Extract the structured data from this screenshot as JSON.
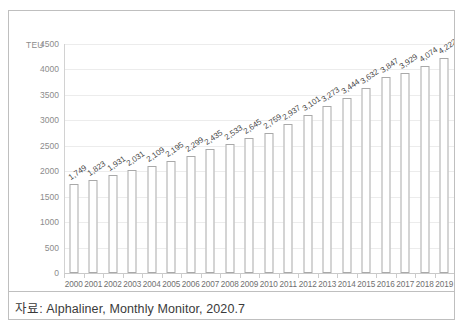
{
  "figure": {
    "unit_label": "TEU",
    "source_caption": "자료: Alphaliner, Monthly Monitor, 2020.7"
  },
  "chart_data": {
    "type": "bar",
    "title": "",
    "xlabel": "",
    "ylabel": "TEU",
    "ylim": [
      0,
      4500
    ],
    "ytick_step": 500,
    "grid": true,
    "legend": "none",
    "bar_fill": "#ffffff",
    "bar_border": "#a9a9a9",
    "gridline_color": "#ececec",
    "label_color": "#4a4a4a",
    "tick_color": "#8c8c8c",
    "categories": [
      "2000",
      "2001",
      "2002",
      "2003",
      "2004",
      "2005",
      "2006",
      "2007",
      "2008",
      "2009",
      "2010",
      "2011",
      "2012",
      "2013",
      "2014",
      "2015",
      "2016",
      "2017",
      "2018",
      "2019"
    ],
    "values": [
      1749,
      1823,
      1931,
      2031,
      2109,
      2195,
      2299,
      2435,
      2533,
      2645,
      2759,
      2937,
      3101,
      3273,
      3444,
      3632,
      3847,
      3929,
      4074,
      4222
    ],
    "data_labels": [
      "1,749",
      "1,823",
      "1,931",
      "2,031",
      "2,109",
      "2,195",
      "2,299",
      "2,435",
      "2,533",
      "2,645",
      "2,759",
      "2,937",
      "3,101",
      "3,273",
      "3,444",
      "3,632",
      "3,847",
      "3,929",
      "4,074",
      "4,222"
    ],
    "ytick_labels": [
      "0",
      "500",
      "1000",
      "1500",
      "2000",
      "2500",
      "3000",
      "3500",
      "4000",
      "4500"
    ],
    "ytick_values": [
      0,
      500,
      1000,
      1500,
      2000,
      2500,
      3000,
      3500,
      4000,
      4500
    ]
  }
}
